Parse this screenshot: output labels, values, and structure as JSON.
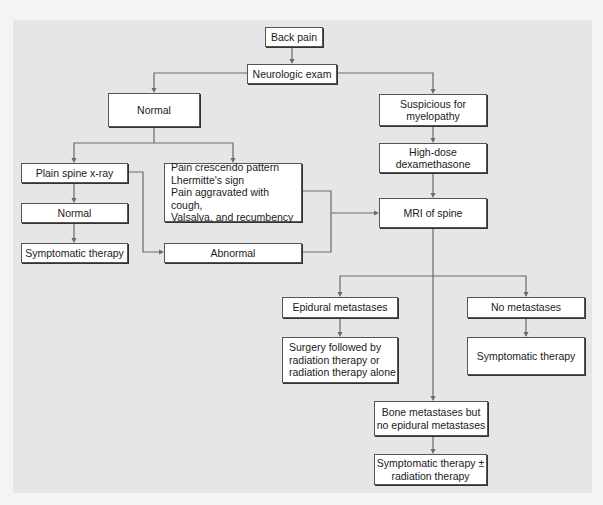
{
  "diagram": {
    "type": "flowchart",
    "title": "Back pain",
    "colors": {
      "panel_background": "#e6e6e6",
      "page_background": "#f4f4f4",
      "box_fill": "#ffffff",
      "box_border": "#555555",
      "connector": "#6a6a6a"
    },
    "nodes": {
      "back_pain": "Back pain",
      "neuro_exam": "Neurologic exam",
      "normal_exam": "Normal",
      "suspicious": "Suspicious for\nmyelopathy",
      "dexamethasone": "High-dose\ndexamethasone",
      "plain_xray": "Plain spine x-ray",
      "xray_normal": "Normal",
      "symptomatic_left": "Symptomatic therapy",
      "red_flags": "Pain crescendo pattern\nLhermitte's sign\nPain aggravated with cough,\nValsalva, and recumbency",
      "abnormal": "Abnormal",
      "mri": "MRI of spine",
      "epidural": "Epidural metastases",
      "surgery": "Surgery followed by\nradiation therapy or\nradiation therapy alone",
      "no_mets": "No metastases",
      "symptomatic_right": "Symptomatic therapy",
      "bone_mets": "Bone metastases but\nno epidural metastases",
      "symptomatic_radiation": "Symptomatic therapy ±\nradiation therapy"
    },
    "edges": [
      [
        "back_pain",
        "neuro_exam"
      ],
      [
        "neuro_exam",
        "normal_exam"
      ],
      [
        "neuro_exam",
        "suspicious"
      ],
      [
        "suspicious",
        "dexamethasone"
      ],
      [
        "dexamethasone",
        "mri"
      ],
      [
        "normal_exam",
        "plain_xray"
      ],
      [
        "normal_exam",
        "red_flags"
      ],
      [
        "plain_xray",
        "xray_normal"
      ],
      [
        "xray_normal",
        "symptomatic_left"
      ],
      [
        "plain_xray",
        "abnormal"
      ],
      [
        "red_flags",
        "mri"
      ],
      [
        "abnormal",
        "mri"
      ],
      [
        "mri",
        "epidural"
      ],
      [
        "mri",
        "no_mets"
      ],
      [
        "mri",
        "bone_mets"
      ],
      [
        "epidural",
        "surgery"
      ],
      [
        "no_mets",
        "symptomatic_right"
      ],
      [
        "bone_mets",
        "symptomatic_radiation"
      ]
    ]
  }
}
